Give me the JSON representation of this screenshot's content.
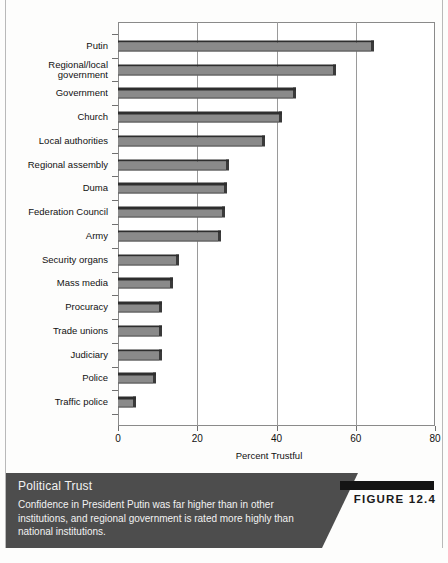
{
  "chart_data": {
    "type": "bar",
    "orientation": "horizontal",
    "title": "",
    "xlabel": "Percent Trustful",
    "ylabel": "",
    "xlim": [
      0,
      80
    ],
    "xticks": [
      0,
      20,
      40,
      60,
      80
    ],
    "grid": true,
    "legend": "none",
    "categories": [
      "Putin",
      "Regional/local\ngovernment",
      "Government",
      "Church",
      "Local authorities",
      "Regional assembly",
      "Duma",
      "Federation Council",
      "Army",
      "Security organs",
      "Mass media",
      "Procuracy",
      "Trade unions",
      "Judiciary",
      "Police",
      "Traffic police"
    ],
    "values": [
      64.5,
      55,
      45,
      41.5,
      37,
      28,
      27.5,
      27,
      26,
      15.5,
      14,
      11,
      11,
      11,
      9.5,
      4.5
    ],
    "bar_color": "#8a8a8a",
    "bar_edge_color": "#2e2e2e"
  },
  "axis": {
    "tick_labels": [
      "0",
      "20",
      "40",
      "60",
      "80"
    ],
    "title": "Percent Trustful"
  },
  "caption": {
    "title": "Political Trust",
    "body": "Confidence in President Putin was far higher than in other institutions, and regional government is rated more highly than national institutions.",
    "figure_label": "FIGURE 12.4",
    "band_color": "#4d4d4d"
  }
}
